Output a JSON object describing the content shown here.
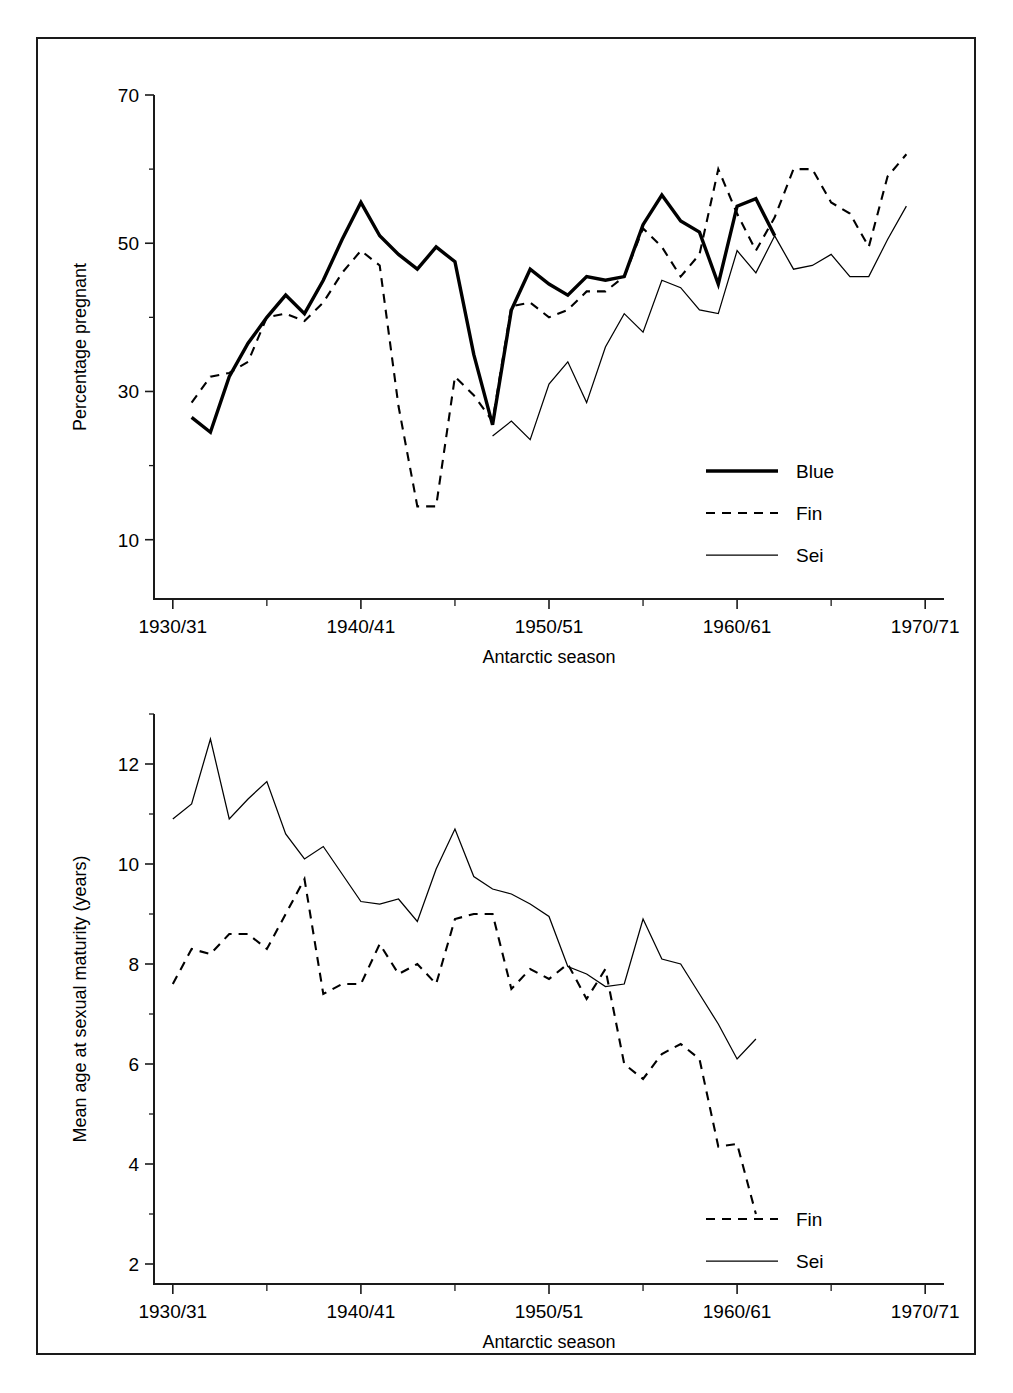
{
  "figure": {
    "background": "#ffffff",
    "frame_color": "#1a1a1a"
  },
  "chart_data": [
    {
      "id": "percentage-pregnant",
      "type": "line",
      "title": "",
      "xlabel": "Antarctic season",
      "ylabel": "Percentage pregnant",
      "xlim": [
        1929,
        1971
      ],
      "ylim": [
        2,
        70
      ],
      "grid": false,
      "legend_position": "bottom-right",
      "x_tick_labels": [
        "1930/31",
        "1940/41",
        "1950/51",
        "1960/61",
        "1970/71"
      ],
      "x_tick_values": [
        1930,
        1940,
        1950,
        1960,
        1970
      ],
      "x_minor_tick_values": [
        1935,
        1945,
        1955,
        1965
      ],
      "y_tick_values": [
        10,
        30,
        50,
        70
      ],
      "y_tick_labels": [
        "10",
        "30",
        "50",
        "70"
      ],
      "y_minor_tick_values": [
        20,
        40,
        60
      ],
      "series": [
        {
          "name": "Blue",
          "style": "thick-solid",
          "color": "#000000",
          "x": [
            1931,
            1932,
            1933,
            1934,
            1935,
            1936,
            1937,
            1938,
            1939,
            1940,
            1941,
            1942,
            1943,
            1944,
            1945,
            1946,
            1947,
            1948,
            1949,
            1950,
            1951,
            1952,
            1953,
            1954,
            1955,
            1956,
            1957,
            1958,
            1959,
            1960,
            1961,
            1962
          ],
          "values": [
            26.5,
            24.5,
            32.0,
            36.5,
            40.0,
            43.0,
            40.5,
            45.0,
            50.5,
            55.5,
            51.0,
            48.5,
            46.5,
            49.5,
            47.5,
            35.0,
            25.5,
            41.0,
            46.5,
            44.5,
            43.0,
            45.5,
            45.0,
            45.5,
            52.5,
            56.5,
            53.0,
            51.5,
            44.5,
            55.0,
            56.0,
            51.0
          ]
        },
        {
          "name": "Fin",
          "style": "dashed",
          "color": "#000000",
          "x": [
            1931,
            1932,
            1933,
            1934,
            1935,
            1936,
            1937,
            1938,
            1939,
            1940,
            1941,
            1942,
            1943,
            1944,
            1945,
            1946,
            1947,
            1948,
            1949,
            1950,
            1951,
            1952,
            1953,
            1954,
            1955,
            1956,
            1957,
            1958,
            1959,
            1960,
            1961,
            1962,
            1963,
            1964,
            1965,
            1966,
            1967,
            1968,
            1969
          ],
          "values": [
            28.5,
            32.0,
            32.5,
            34.0,
            40.0,
            40.5,
            39.5,
            42.0,
            46.0,
            49.0,
            47.0,
            28.0,
            14.5,
            14.5,
            32.0,
            29.5,
            26.0,
            41.5,
            42.0,
            40.0,
            41.0,
            43.5,
            43.5,
            45.5,
            52.0,
            49.5,
            45.5,
            48.5,
            60.0,
            54.0,
            49.0,
            53.5,
            60.0,
            60.0,
            55.5,
            54.0,
            49.5,
            59.0,
            62.0
          ]
        },
        {
          "name": "Sei",
          "style": "thin-solid",
          "color": "#000000",
          "x": [
            1947,
            1948,
            1949,
            1950,
            1951,
            1952,
            1953,
            1954,
            1955,
            1956,
            1957,
            1958,
            1959,
            1960,
            1961,
            1962,
            1963,
            1964,
            1965,
            1966,
            1967,
            1968,
            1969
          ],
          "values": [
            24.0,
            26.0,
            23.5,
            31.0,
            34.0,
            28.5,
            36.0,
            40.5,
            38.0,
            45.0,
            44.0,
            41.0,
            40.5,
            49.0,
            46.0,
            51.0,
            46.5,
            47.0,
            48.5,
            45.5,
            45.5,
            50.5,
            55.0
          ]
        }
      ]
    },
    {
      "id": "mean-age-sexual-maturity",
      "type": "line",
      "title": "",
      "xlabel": "Antarctic season",
      "ylabel": "Mean age at sexual maturity (years)",
      "xlim": [
        1929,
        1971
      ],
      "ylim": [
        1.6,
        13.0
      ],
      "grid": false,
      "legend_position": "bottom-right",
      "x_tick_labels": [
        "1930/31",
        "1940/41",
        "1950/51",
        "1960/61",
        "1970/71"
      ],
      "x_tick_values": [
        1930,
        1940,
        1950,
        1960,
        1970
      ],
      "x_minor_tick_values": [
        1935,
        1945,
        1955,
        1965
      ],
      "y_tick_values": [
        2,
        4,
        6,
        8,
        10,
        12
      ],
      "y_tick_labels": [
        "2",
        "4",
        "6",
        "8",
        "10",
        "12"
      ],
      "y_minor_tick_values": [
        3,
        5,
        7,
        9,
        11,
        13
      ],
      "series": [
        {
          "name": "Fin",
          "style": "dashed",
          "color": "#000000",
          "x": [
            1930,
            1931,
            1932,
            1933,
            1934,
            1935,
            1936,
            1937,
            1938,
            1939,
            1940,
            1941,
            1942,
            1943,
            1944,
            1945,
            1946,
            1947,
            1948,
            1949,
            1950,
            1951,
            1952,
            1953,
            1954,
            1955,
            1956,
            1957,
            1958,
            1959,
            1960,
            1961
          ],
          "values": [
            7.6,
            8.3,
            8.2,
            8.6,
            8.6,
            8.3,
            9.0,
            9.7,
            7.4,
            7.6,
            7.6,
            8.4,
            7.8,
            8.0,
            7.6,
            8.9,
            9.0,
            9.0,
            7.5,
            7.9,
            7.7,
            8.0,
            7.3,
            7.9,
            6.0,
            5.7,
            6.2,
            6.4,
            6.1,
            4.35,
            4.4,
            3.0
          ]
        },
        {
          "name": "Sei",
          "style": "thin-solid",
          "color": "#000000",
          "x": [
            1930,
            1931,
            1932,
            1933,
            1934,
            1935,
            1936,
            1937,
            1938,
            1939,
            1940,
            1941,
            1942,
            1943,
            1944,
            1945,
            1946,
            1947,
            1948,
            1949,
            1950,
            1951,
            1952,
            1953,
            1954,
            1955,
            1956,
            1957,
            1958,
            1959,
            1960,
            1961
          ],
          "values": [
            10.9,
            11.2,
            12.5,
            10.9,
            11.3,
            11.65,
            10.6,
            10.1,
            10.35,
            9.8,
            9.25,
            9.2,
            9.3,
            8.85,
            9.9,
            10.7,
            9.75,
            9.5,
            9.4,
            9.2,
            8.95,
            7.95,
            7.8,
            7.55,
            7.6,
            8.9,
            8.1,
            8.0,
            7.4,
            6.8,
            6.1,
            6.5
          ]
        }
      ]
    }
  ],
  "top_panel_legend": [
    {
      "label": "Blue",
      "style": "thick-solid"
    },
    {
      "label": "Fin",
      "style": "dashed"
    },
    {
      "label": "Sei",
      "style": "thin-solid"
    }
  ],
  "bottom_panel_legend": [
    {
      "label": "Fin",
      "style": "dashed"
    },
    {
      "label": "Sei",
      "style": "thin-solid"
    }
  ]
}
